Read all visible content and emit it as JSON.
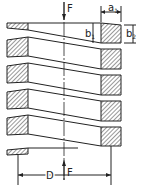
{
  "labels": {
    "force_top": "F",
    "force_bottom": "F",
    "a1": "a",
    "a1_sub": "1",
    "b1": "b",
    "b1_sub": "1",
    "b2": "b",
    "b2_sub": "2",
    "diameter": "D"
  },
  "colors": {
    "line": "#222222",
    "bg": "#ffffff"
  }
}
